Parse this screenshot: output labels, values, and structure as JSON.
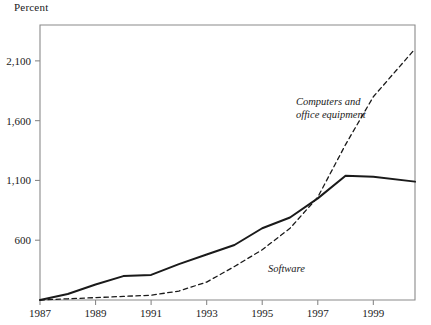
{
  "figure": {
    "unit_label": "Percent",
    "background": "#ffffff",
    "axis_color": "#8a8a8a",
    "text_color": "#1a1a1a"
  },
  "annotations": [
    {
      "name": "computers-and-office-equipment-label",
      "line1": "Computers and",
      "line2": "office equipment",
      "x": 296,
      "y": 105
    },
    {
      "name": "software-label",
      "line1": "Software",
      "line2": "",
      "x": 268,
      "y": 272
    }
  ],
  "chart_data": {
    "type": "line",
    "title": "",
    "subtitle": "",
    "xlabel": "",
    "ylabel": "Percent",
    "xlim": [
      1987,
      2000.5
    ],
    "ylim": [
      100,
      2400
    ],
    "grid": false,
    "legend": "annotated-inline",
    "xticks": [
      1987,
      1989,
      1991,
      1993,
      1995,
      1997,
      1999
    ],
    "xtick_labels": [
      "1987",
      "1989",
      "1991",
      "1993",
      "1995",
      "1997",
      "1999"
    ],
    "yticks": [
      600,
      1100,
      1600,
      2100
    ],
    "ytick_labels": [
      "600",
      "1,100",
      "1,600",
      "2,100"
    ],
    "series": [
      {
        "name": "Software",
        "style": "solid",
        "color": "#1a1a1a",
        "width": 2.0,
        "x": [
          1987,
          1988,
          1989,
          1990,
          1991,
          1992,
          1993,
          1994,
          1995,
          1996,
          1997,
          1998,
          1999,
          2000.5
        ],
        "values": [
          100,
          150,
          230,
          300,
          310,
          400,
          480,
          560,
          700,
          790,
          950,
          1140,
          1130,
          1090
        ]
      },
      {
        "name": "Computers and office equipment",
        "style": "dashed",
        "color": "#1a1a1a",
        "width": 1.3,
        "x": [
          1987,
          1988,
          1989,
          1990,
          1991,
          1992,
          1993,
          1994,
          1995,
          1996,
          1997,
          1998,
          1999,
          2000.5
        ],
        "values": [
          100,
          110,
          120,
          130,
          140,
          175,
          250,
          380,
          520,
          700,
          960,
          1400,
          1800,
          2200
        ]
      }
    ]
  }
}
